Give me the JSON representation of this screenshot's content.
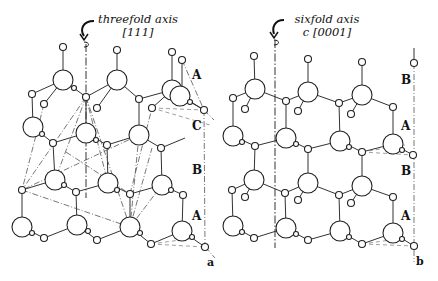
{
  "figure": {
    "panel_a": {
      "title_line1": "threefold axis",
      "title_line2": "[111]",
      "layer_labels": [
        "A",
        "C",
        "B",
        "A"
      ],
      "panel_label": "a"
    },
    "panel_b": {
      "title_line1": "sixfold axis",
      "title_line2": "c [0001]",
      "layer_labels": [
        "B",
        "A",
        "B",
        "A"
      ],
      "panel_label": "b"
    },
    "colors": {
      "line": "#222222",
      "background": "#ffffff"
    }
  }
}
